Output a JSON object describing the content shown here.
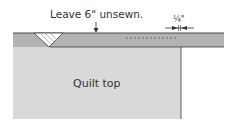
{
  "diagram": {
    "labels": {
      "unsewn": "Leave 6\" unsewn.",
      "seam_allowance": "¼\"",
      "quilt_top": "Quilt top"
    },
    "colors": {
      "quilt_top_fill": "#d9d9d9",
      "binding_fill": "#b3b3b3",
      "outline": "#3a3a3a",
      "background": "#ffffff"
    }
  }
}
